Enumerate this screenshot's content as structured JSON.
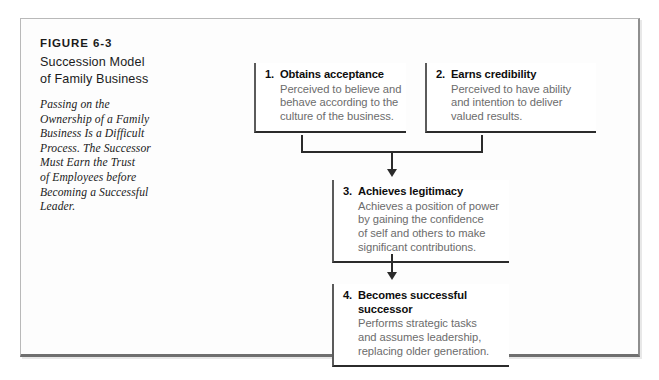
{
  "figure": {
    "number_label": "FIGURE 6-3",
    "title_line_1": "Succession Model",
    "title_line_2": "of Family Business",
    "description_lines": [
      "Passing on the",
      "Ownership of a Family",
      "Business Is a Difficult",
      "Process. The Successor",
      "Must Earn the Trust",
      "of Employees before",
      "Becoming a Successful",
      "Leader."
    ]
  },
  "diagram": {
    "boxes": [
      {
        "number": "1.",
        "heading": "Obtains acceptance",
        "body_lines": [
          "Perceived to believe and",
          "behave according to the",
          "culture of the business."
        ]
      },
      {
        "number": "2.",
        "heading": "Earns credibility",
        "body_lines": [
          "Perceived to have ability",
          "and intention to deliver",
          "valued results."
        ]
      },
      {
        "number": "3.",
        "heading": "Achieves legitimacy",
        "body_lines": [
          "Achieves a position of power",
          "by gaining the confidence",
          "of self and others to make",
          "significant contributions."
        ]
      },
      {
        "number": "4.",
        "heading_line_1": "Becomes successful",
        "heading_line_2": "successor",
        "body_lines": [
          "Performs strategic tasks",
          "and assumes leadership,",
          "replacing older generation."
        ]
      }
    ],
    "colors": {
      "box_border_dark": "#2b2b2b",
      "box_border_left": "#5b5b5b",
      "body_text": "#6c6c6c",
      "heading_text": "#0d0d0d",
      "frame_border": "#b9b9b9"
    }
  }
}
